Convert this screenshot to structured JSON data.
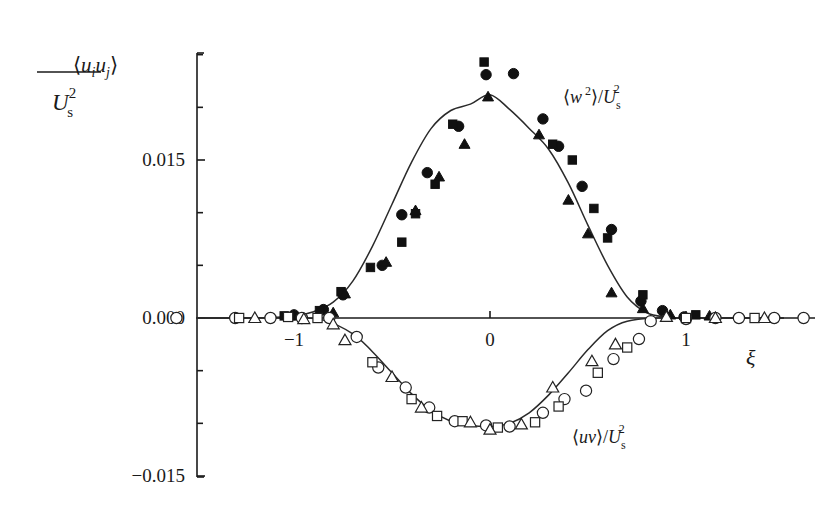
{
  "chart_data": {
    "type": "scatter",
    "title": "",
    "ylabel": {
      "numerator": "⟨u_i u_j⟩",
      "denominator": "U_s^2"
    },
    "xlabel": "ξ",
    "xlim": [
      -1.5,
      1.65
    ],
    "ylim": [
      -0.015,
      0.025
    ],
    "x_ticks": [
      -1,
      0,
      1
    ],
    "x_tick_labels": [
      "−1",
      "0",
      "1"
    ],
    "y_ticks_major": [
      0.015,
      0.0,
      -0.015
    ],
    "y_tick_labels": [
      "0.015",
      "0.000",
      "−0.015"
    ],
    "y_ticks_minor": [
      0.025,
      0.02,
      0.01,
      0.005,
      -0.005,
      -0.01
    ],
    "grid": false,
    "annotations": [
      {
        "text": "⟨w²⟩/U_s²",
        "x": 0.55,
        "y": 0.0215
      },
      {
        "text": "⟨uv⟩/U_s²",
        "x": 0.55,
        "y": -0.0112
      }
    ],
    "series": [
      {
        "name": "⟨w²⟩/U_s² model",
        "kind": "line",
        "x": [
          -1.5,
          -1.2,
          -1.0,
          -0.9,
          -0.8,
          -0.7,
          -0.6,
          -0.5,
          -0.4,
          -0.3,
          -0.2,
          -0.1,
          0.0,
          0.1,
          0.2,
          0.3,
          0.4,
          0.5,
          0.6,
          0.7,
          0.8,
          0.9,
          1.0,
          1.5
        ],
        "y": [
          0.0,
          0.0,
          0.0002,
          0.0006,
          0.0015,
          0.0035,
          0.0068,
          0.0108,
          0.0148,
          0.018,
          0.0197,
          0.0203,
          0.0212,
          0.0198,
          0.018,
          0.016,
          0.0128,
          0.0088,
          0.005,
          0.002,
          0.0005,
          0.0001,
          0.0,
          0.0
        ]
      },
      {
        "name": "⟨uv⟩/U_s² model",
        "kind": "line",
        "x": [
          -1.5,
          -1.0,
          -0.85,
          -0.7,
          -0.6,
          -0.5,
          -0.4,
          -0.3,
          -0.2,
          -0.1,
          0.0,
          0.1,
          0.2,
          0.3,
          0.4,
          0.5,
          0.6,
          0.7,
          0.85,
          1.0,
          1.5
        ],
        "y": [
          0.0,
          0.0,
          -0.0002,
          -0.0015,
          -0.0032,
          -0.0052,
          -0.0072,
          -0.0088,
          -0.0098,
          -0.0102,
          -0.0103,
          -0.01,
          -0.009,
          -0.0073,
          -0.0052,
          -0.003,
          -0.0012,
          -0.0003,
          0.0,
          0.0,
          0.0
        ]
      },
      {
        "name": "⟨w²⟩ filled circles",
        "kind": "marker",
        "marker": "filled-circle",
        "x": [
          -1.0,
          -0.85,
          -0.75,
          -0.55,
          -0.45,
          -0.32,
          -0.16,
          -0.02,
          0.12,
          0.27,
          0.35,
          0.47,
          0.62,
          0.77,
          0.88,
          0.99
        ],
        "y": [
          0.0003,
          0.0008,
          0.0022,
          0.005,
          0.0098,
          0.0138,
          0.0182,
          0.0231,
          0.0232,
          0.0189,
          0.0163,
          0.0125,
          0.0084,
          0.0016,
          0.0007,
          0.0001
        ]
      },
      {
        "name": "⟨w²⟩ filled squares",
        "kind": "marker",
        "marker": "filled-square",
        "x": [
          -1.05,
          -0.87,
          -0.76,
          -0.61,
          -0.45,
          -0.38,
          -0.28,
          -0.19,
          -0.03,
          0.32,
          0.42,
          0.53,
          0.6,
          0.78,
          1.05
        ],
        "y": [
          0.0002,
          0.0007,
          0.0025,
          0.0048,
          0.0072,
          0.0099,
          0.0127,
          0.0184,
          0.0243,
          0.0165,
          0.015,
          0.0104,
          0.0076,
          0.0022,
          0.0003
        ]
      },
      {
        "name": "⟨w²⟩ filled triangles",
        "kind": "marker",
        "marker": "filled-triangle",
        "x": [
          -1.0,
          -0.8,
          -0.74,
          -0.53,
          -0.38,
          -0.26,
          -0.13,
          -0.01,
          0.25,
          0.4,
          0.5,
          0.62,
          0.78,
          0.92,
          1.12
        ],
        "y": [
          0.0002,
          0.0005,
          0.0023,
          0.0053,
          0.0102,
          0.0134,
          0.0165,
          0.021,
          0.0174,
          0.0112,
          0.008,
          0.0024,
          0.0009,
          0.0003,
          0.0002
        ]
      },
      {
        "name": "⟨uv⟩ open circles",
        "kind": "marker",
        "marker": "open-circle",
        "x": [
          -1.6,
          -1.3,
          -1.12,
          -0.96,
          -0.82,
          -0.68,
          -0.57,
          -0.43,
          -0.31,
          -0.18,
          -0.02,
          0.1,
          0.27,
          0.38,
          0.49,
          0.63,
          0.76,
          0.82,
          1.0,
          1.15,
          1.27,
          1.45,
          1.6
        ],
        "y": [
          0.0,
          0.0,
          0.0,
          0.0,
          0.0,
          -0.0018,
          -0.0047,
          -0.0066,
          -0.0085,
          -0.0098,
          -0.0102,
          -0.0103,
          -0.009,
          -0.0077,
          -0.0069,
          -0.0039,
          -0.002,
          -0.0003,
          -0.0001,
          0.0,
          0.0,
          0.0,
          0.0
        ]
      },
      {
        "name": "⟨uv⟩ open squares",
        "kind": "marker",
        "marker": "open-square",
        "x": [
          -1.28,
          -1.03,
          -0.88,
          -0.6,
          -0.4,
          -0.27,
          -0.14,
          0.04,
          0.23,
          0.35,
          0.55,
          0.7,
          1.0,
          1.35
        ],
        "y": [
          0.0,
          0.0001,
          0.0,
          -0.0042,
          -0.0077,
          -0.0093,
          -0.0098,
          -0.0104,
          -0.0099,
          -0.0084,
          -0.0052,
          -0.0028,
          0.0,
          0.0
        ]
      },
      {
        "name": "⟨uv⟩ open triangles",
        "kind": "marker",
        "marker": "open-triangle",
        "x": [
          -1.2,
          -0.95,
          -0.8,
          -0.74,
          -0.5,
          -0.35,
          -0.1,
          0.0,
          0.16,
          0.32,
          0.52,
          0.64,
          0.9,
          1.15,
          1.4
        ],
        "y": [
          0.0,
          -0.0001,
          -0.0006,
          -0.0021,
          -0.0056,
          -0.0085,
          -0.0099,
          -0.0106,
          -0.0101,
          -0.0066,
          -0.0041,
          -0.0025,
          0.0001,
          0.0,
          0.0
        ]
      }
    ]
  }
}
